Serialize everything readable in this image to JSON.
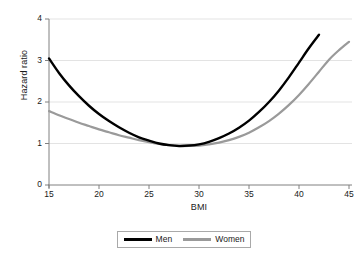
{
  "chart_data": {
    "type": "line",
    "title": "",
    "xlabel": "BMI",
    "ylabel": "Hazard ratio",
    "xlim": [
      15,
      45
    ],
    "ylim": [
      0,
      4
    ],
    "xticks": [
      "15",
      "20",
      "25",
      "30",
      "35",
      "40",
      "45"
    ],
    "yticks": [
      "0",
      "1",
      "2",
      "3",
      "4"
    ],
    "grid": "horizontal",
    "legend_position": "bottom-center",
    "series": [
      {
        "name": "Men",
        "color": "#000000",
        "x": [
          15,
          16,
          17,
          18,
          19,
          20,
          21,
          22,
          23,
          24,
          25,
          26,
          27,
          28,
          29,
          30,
          31,
          32,
          33,
          34,
          35,
          36,
          37,
          38,
          39,
          40,
          41,
          42
        ],
        "values": [
          3.05,
          2.7,
          2.4,
          2.14,
          1.91,
          1.71,
          1.54,
          1.39,
          1.26,
          1.15,
          1.07,
          1.0,
          0.96,
          0.94,
          0.95,
          0.98,
          1.04,
          1.13,
          1.24,
          1.38,
          1.55,
          1.76,
          2.0,
          2.28,
          2.6,
          2.95,
          3.3,
          3.62
        ]
      },
      {
        "name": "Women",
        "color": "#9a9a9a",
        "x": [
          15,
          16,
          17,
          18,
          19,
          20,
          21,
          22,
          23,
          24,
          25,
          26,
          27,
          28,
          29,
          30,
          31,
          32,
          33,
          34,
          35,
          36,
          37,
          38,
          39,
          40,
          41,
          42,
          43,
          44,
          45
        ],
        "values": [
          1.78,
          1.68,
          1.59,
          1.5,
          1.42,
          1.34,
          1.27,
          1.2,
          1.14,
          1.08,
          1.03,
          0.99,
          0.96,
          0.94,
          0.94,
          0.95,
          0.98,
          1.02,
          1.08,
          1.16,
          1.26,
          1.39,
          1.54,
          1.72,
          1.93,
          2.17,
          2.44,
          2.73,
          3.02,
          3.25,
          3.45
        ]
      }
    ],
    "legend": [
      {
        "label": "Men",
        "swatch": "men"
      },
      {
        "label": "Women",
        "swatch": "women"
      }
    ],
    "colors": {
      "men": "#000000",
      "women": "#9a9a9a",
      "grid": "#e3e3e3",
      "axis": "#808080",
      "text": "#1a1a1a"
    }
  }
}
